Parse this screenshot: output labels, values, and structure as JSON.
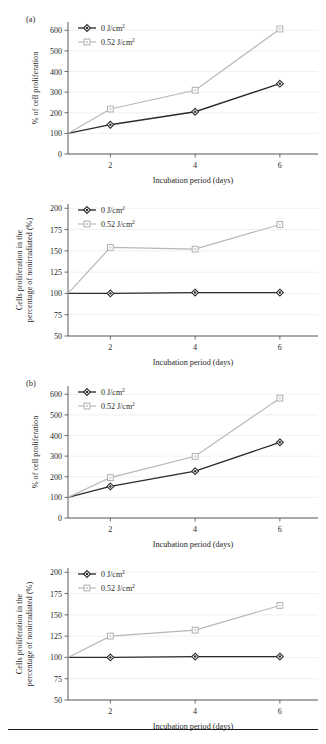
{
  "figure": {
    "panels": [
      {
        "tag": "(a)"
      },
      {
        "tag": "(b)"
      }
    ],
    "legend_series": [
      {
        "label": "0 J/cm",
        "sup": "2",
        "color": "#2b2b2b",
        "marker": "diamond"
      },
      {
        "label": "0.52 J/cm",
        "sup": "2",
        "color": "#b7b7b7",
        "marker": "square"
      }
    ]
  },
  "chart_data": [
    {
      "type": "line",
      "panel": "(a)",
      "index": 0,
      "title": "",
      "xlabel": "Incubation period (days)",
      "ylabel": "% of cell proliferation",
      "x": [
        1,
        2,
        4,
        6
      ],
      "xticks": [
        2,
        4,
        6
      ],
      "xticklabels": [
        "2",
        "4",
        "6"
      ],
      "xlim": [
        1,
        6.9
      ],
      "yticks": [
        0,
        100,
        200,
        300,
        400,
        500,
        600
      ],
      "yticklabels": [
        "0",
        "100",
        "200",
        "300",
        "400",
        "500",
        "600"
      ],
      "ylim": [
        0,
        640
      ],
      "grid": true,
      "legend_position": "top-left",
      "series": [
        {
          "name": "0 J/cm2",
          "color": "#2b2b2b",
          "marker": "diamond",
          "values": [
            100,
            142,
            205,
            341
          ]
        },
        {
          "name": "0.52 J/cm2",
          "color": "#b7b7b7",
          "marker": "square",
          "values": [
            100,
            218,
            309,
            606
          ]
        }
      ]
    },
    {
      "type": "line",
      "panel": "(a)",
      "index": 1,
      "title": "",
      "xlabel": "Incubation period (days)",
      "ylabel": "Cells proliferation in the percentage of nonirradiated (%)",
      "x": [
        1,
        2,
        4,
        6
      ],
      "xticks": [
        2,
        4,
        6
      ],
      "xticklabels": [
        "2",
        "4",
        "6"
      ],
      "xlim": [
        1,
        6.9
      ],
      "yticks": [
        50,
        75,
        100,
        125,
        150,
        175,
        200
      ],
      "yticklabels": [
        "50",
        "75",
        "100",
        "125",
        "150",
        "175",
        "200"
      ],
      "ylim": [
        50,
        205
      ],
      "grid": true,
      "legend_position": "top-left",
      "series": [
        {
          "name": "0 J/cm2",
          "color": "#2b2b2b",
          "marker": "diamond",
          "values": [
            100,
            100,
            101,
            101
          ]
        },
        {
          "name": "0.52 J/cm2",
          "color": "#b7b7b7",
          "marker": "square",
          "values": [
            100,
            154,
            152,
            181
          ]
        }
      ]
    },
    {
      "type": "line",
      "panel": "(b)",
      "index": 2,
      "title": "",
      "xlabel": "Incubation period (days)",
      "ylabel": "% of cell proliferation",
      "x": [
        1,
        2,
        4,
        6
      ],
      "xticks": [
        2,
        4,
        6
      ],
      "xticklabels": [
        "2",
        "4",
        "6"
      ],
      "xlim": [
        1,
        6.9
      ],
      "yticks": [
        0,
        100,
        200,
        300,
        400,
        500,
        600
      ],
      "yticklabels": [
        "0",
        "100",
        "200",
        "300",
        "400",
        "500",
        "600"
      ],
      "ylim": [
        0,
        640
      ],
      "grid": true,
      "legend_position": "top-left",
      "series": [
        {
          "name": "0 J/cm2",
          "color": "#2b2b2b",
          "marker": "diamond",
          "values": [
            100,
            153,
            227,
            367
          ]
        },
        {
          "name": "0.52 J/cm2",
          "color": "#b7b7b7",
          "marker": "square",
          "values": [
            100,
            196,
            299,
            581
          ]
        }
      ]
    },
    {
      "type": "line",
      "panel": "(b)",
      "index": 3,
      "title": "",
      "xlabel": "Incubation period (days)",
      "ylabel": "Cells proliferation in the percentage of nonirradiated (%)",
      "x": [
        1,
        2,
        4,
        6
      ],
      "xticks": [
        2,
        4,
        6
      ],
      "xticklabels": [
        "2",
        "4",
        "6"
      ],
      "xlim": [
        1,
        6.9
      ],
      "yticks": [
        50,
        75,
        100,
        125,
        150,
        175,
        200
      ],
      "yticklabels": [
        "50",
        "75",
        "100",
        "125",
        "150",
        "175",
        "200"
      ],
      "ylim": [
        50,
        205
      ],
      "grid": true,
      "legend_position": "top-left",
      "series": [
        {
          "name": "0 J/cm2",
          "color": "#2b2b2b",
          "marker": "diamond",
          "values": [
            100,
            100,
            101,
            101
          ]
        },
        {
          "name": "0.52 J/cm2",
          "color": "#b7b7b7",
          "marker": "square",
          "values": [
            100,
            125,
            132,
            161
          ]
        }
      ]
    }
  ]
}
